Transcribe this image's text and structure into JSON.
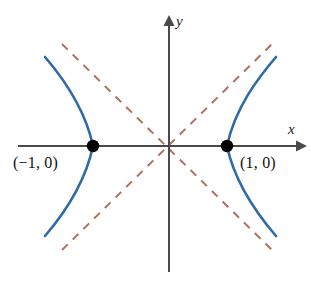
{
  "figure": {
    "background_color": "#ffffff",
    "axes": {
      "color": "#4a4a4a",
      "stroke_width": 2,
      "x_axis": {
        "label": "x",
        "start_px": [
          18,
          146
        ],
        "end_px": [
          303,
          146
        ],
        "arrow": "right"
      },
      "y_axis": {
        "label": "y",
        "start_px": [
          169,
          272
        ],
        "end_px": [
          169,
          18
        ],
        "arrow": "up"
      },
      "origin_px": [
        169,
        146
      ]
    },
    "curve": {
      "color": "#2f6aa8",
      "stroke_width": 2.6,
      "equation": "x^2 - y^2 = 1",
      "branches": [
        {
          "name": "left-branch",
          "vertex": "(-1, 0)",
          "vertex_px": [
            93,
            146
          ],
          "top_end_px": [
            45,
            57
          ],
          "bottom_end_px": [
            45,
            236
          ]
        },
        {
          "name": "right-branch",
          "vertex": "(1, 0)",
          "vertex_px": [
            227,
            146
          ],
          "top_end_px": [
            276,
            57
          ],
          "bottom_end_px": [
            276,
            236
          ]
        }
      ]
    },
    "asymptotes": {
      "color": "#b0705f",
      "stroke_width": 2,
      "dash_pattern": "8 7",
      "lines": [
        {
          "name": "asymptote-positive-slope",
          "equation": "y = x",
          "from_px": [
            62,
            44
          ],
          "to_px": [
            272,
            250
          ]
        },
        {
          "name": "asymptote-negative-slope",
          "equation": "y = -x",
          "from_px": [
            62,
            250
          ],
          "to_px": [
            272,
            44
          ]
        }
      ]
    },
    "points": [
      {
        "name": "left-vertex",
        "label": "(−1, 0)",
        "coords": [
          -1,
          0
        ],
        "pixel": [
          93,
          146
        ],
        "radius": 6,
        "color": "#000000"
      },
      {
        "name": "right-vertex",
        "label": "(1, 0)",
        "coords": [
          1,
          0
        ],
        "pixel": [
          227,
          146
        ],
        "radius": 6,
        "color": "#000000"
      }
    ],
    "labels": {
      "y_axis_label": "y",
      "x_axis_label": "x",
      "left_vertex_label": "(−1, 0)",
      "right_vertex_label": "(1, 0)"
    },
    "top_edge_artifact": "· · · · · ·"
  }
}
